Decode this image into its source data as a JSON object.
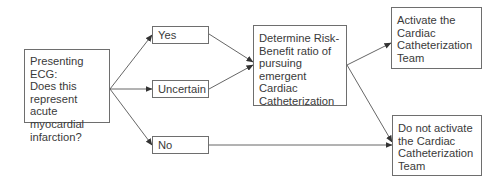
{
  "diagram": {
    "type": "flowchart",
    "nodes": {
      "presenting": {
        "label": "Presenting ECG:\nDoes this\nrepresent acute\nmyocardial\ninfarction?"
      },
      "yes": {
        "label": "Yes"
      },
      "uncertain": {
        "label": "Uncertain"
      },
      "no": {
        "label": "No"
      },
      "determine": {
        "label": "Determine Risk-\nBenefit ratio of\npursuing\nemergent Cardiac\nCatheterization"
      },
      "activate": {
        "label": "Activate the\nCardiac\nCatheterization\nTeam"
      },
      "do_not_activate": {
        "label": "Do not activate\nthe Cardiac\nCatheterization\nTeam"
      }
    },
    "edges": [
      {
        "from": "presenting",
        "to": "yes"
      },
      {
        "from": "presenting",
        "to": "uncertain"
      },
      {
        "from": "presenting",
        "to": "no"
      },
      {
        "from": "yes",
        "to": "determine"
      },
      {
        "from": "uncertain",
        "to": "determine"
      },
      {
        "from": "determine",
        "to": "activate"
      },
      {
        "from": "determine",
        "to": "do_not_activate"
      },
      {
        "from": "no",
        "to": "do_not_activate"
      }
    ],
    "colors": {
      "line": "#555555",
      "border": "#6e6e6e",
      "text": "#3a3a3a",
      "background": "#ffffff"
    }
  }
}
